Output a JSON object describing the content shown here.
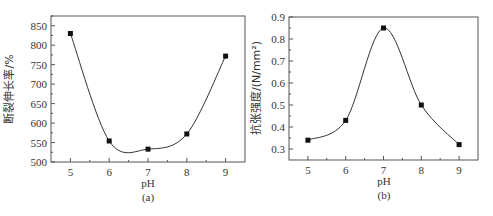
{
  "chart_data": [
    {
      "type": "line",
      "panel_label": "(a)",
      "title": "",
      "xlabel": "pH",
      "ylabel": "断裂伸长率/%",
      "x": [
        5,
        6,
        7,
        8,
        9
      ],
      "values": [
        830,
        554,
        533,
        572,
        772
      ],
      "xticks": [
        "5",
        "6",
        "7",
        "8",
        "9"
      ],
      "yticks": [
        "500",
        "550",
        "600",
        "650",
        "700",
        "750",
        "800",
        "850"
      ],
      "xlim": [
        4.5,
        9.5
      ],
      "ylim": [
        500,
        875
      ],
      "marker": "square",
      "smooth_curve": true,
      "grid": false,
      "legend": null
    },
    {
      "type": "line",
      "panel_label": "(b)",
      "title": "",
      "xlabel": "pH",
      "ylabel": "抗张强度/(N/mm²)",
      "x": [
        5,
        6,
        7,
        8,
        9
      ],
      "values": [
        0.34,
        0.43,
        0.85,
        0.5,
        0.32
      ],
      "xticks": [
        "5",
        "6",
        "7",
        "8",
        "9"
      ],
      "yticks": [
        "0.3",
        "0.4",
        "0.5",
        "0.6",
        "0.7",
        "0.8",
        "0.9"
      ],
      "xlim": [
        4.5,
        9.5
      ],
      "ylim": [
        0.25,
        0.9
      ],
      "marker": "square",
      "smooth_curve": true,
      "grid": false,
      "legend": null
    }
  ],
  "panels": {
    "a": {
      "xlabel": "pH",
      "ylabel": "断裂伸长率/%",
      "caption": "(a)"
    },
    "b": {
      "xlabel": "pH",
      "ylabel": "抗张强度/(N/mm²)",
      "caption": "(b)"
    }
  }
}
